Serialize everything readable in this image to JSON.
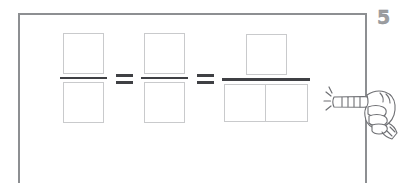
{
  "slide": {
    "page_number": "5",
    "frame_color": "#8d8f92",
    "background_color": "#ffffff",
    "box_stroke_color": "#c9cacc",
    "bar_color": "#3f4044"
  },
  "expression": {
    "description": "Equivalent fraction model: empty boxes arranged as numerator over denominator, joined by equals signs",
    "terms": [
      {
        "id": "fraction-1",
        "numerator_cells": 1,
        "denominator_cells": 1,
        "numerator_label": "",
        "denominator_label": "",
        "bar_width": "narrow"
      },
      {
        "id": "fraction-2",
        "numerator_cells": 1,
        "denominator_cells": 1,
        "numerator_label": "",
        "denominator_label": "",
        "bar_width": "narrow"
      },
      {
        "id": "fraction-3",
        "numerator_cells": 1,
        "denominator_cells": 2,
        "numerator_label": "",
        "denominator_label_left": "",
        "denominator_label_right": "",
        "bar_width": "wide"
      }
    ],
    "operators": [
      "=",
      "="
    ]
  },
  "cursor": {
    "type": "pointing-hand",
    "direction": "left",
    "click_effect": true,
    "label": "hand pointer with click sparkle"
  }
}
